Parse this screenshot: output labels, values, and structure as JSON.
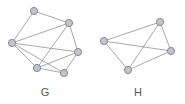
{
  "figure": {
    "title": "",
    "background_color": "#ffffff",
    "width": 185,
    "height": 104
  },
  "style": {
    "node_fill": "#c3c3cb",
    "node_stroke": "#8a8a94",
    "node_radius": 3.6,
    "node_stroke_width": 1,
    "edge_color": "#8f8f99",
    "edge_width": 0.8,
    "label_color": "#555558",
    "label_font_size": 11
  },
  "graphs": [
    {
      "id": "G",
      "label": "G",
      "label_position": {
        "x": 45,
        "y": 96
      },
      "node_count": 6,
      "edge_count": 11,
      "nodes": [
        {
          "id": "g1",
          "name": "top",
          "x": 34,
          "y": 11
        },
        {
          "id": "g2",
          "name": "upper-right",
          "x": 69,
          "y": 23
        },
        {
          "id": "g3",
          "name": "left",
          "x": 12,
          "y": 43
        },
        {
          "id": "g4",
          "name": "right",
          "x": 78,
          "y": 52
        },
        {
          "id": "g5",
          "name": "bottom-left",
          "x": 37,
          "y": 68
        },
        {
          "id": "g6",
          "name": "bottom-right",
          "x": 64,
          "y": 73
        }
      ],
      "edges": [
        {
          "from": "g1",
          "to": "g2"
        },
        {
          "from": "g1",
          "to": "g3"
        },
        {
          "from": "g2",
          "to": "g3"
        },
        {
          "from": "g2",
          "to": "g4"
        },
        {
          "from": "g2",
          "to": "g5"
        },
        {
          "from": "g3",
          "to": "g4"
        },
        {
          "from": "g3",
          "to": "g5"
        },
        {
          "from": "g3",
          "to": "g6"
        },
        {
          "from": "g4",
          "to": "g5"
        },
        {
          "from": "g4",
          "to": "g6"
        },
        {
          "from": "g5",
          "to": "g6"
        }
      ]
    },
    {
      "id": "H",
      "label": "H",
      "label_position": {
        "x": 138,
        "y": 96
      },
      "node_count": 4,
      "edge_count": 6,
      "nodes": [
        {
          "id": "h1",
          "name": "left",
          "x": 104,
          "y": 41
        },
        {
          "id": "h2",
          "name": "top-right",
          "x": 160,
          "y": 22
        },
        {
          "id": "h3",
          "name": "right",
          "x": 171,
          "y": 51
        },
        {
          "id": "h4",
          "name": "bottom",
          "x": 128,
          "y": 70
        }
      ],
      "edges": [
        {
          "from": "h1",
          "to": "h2"
        },
        {
          "from": "h1",
          "to": "h3"
        },
        {
          "from": "h1",
          "to": "h4"
        },
        {
          "from": "h2",
          "to": "h3"
        },
        {
          "from": "h2",
          "to": "h4"
        },
        {
          "from": "h3",
          "to": "h4"
        }
      ]
    }
  ]
}
